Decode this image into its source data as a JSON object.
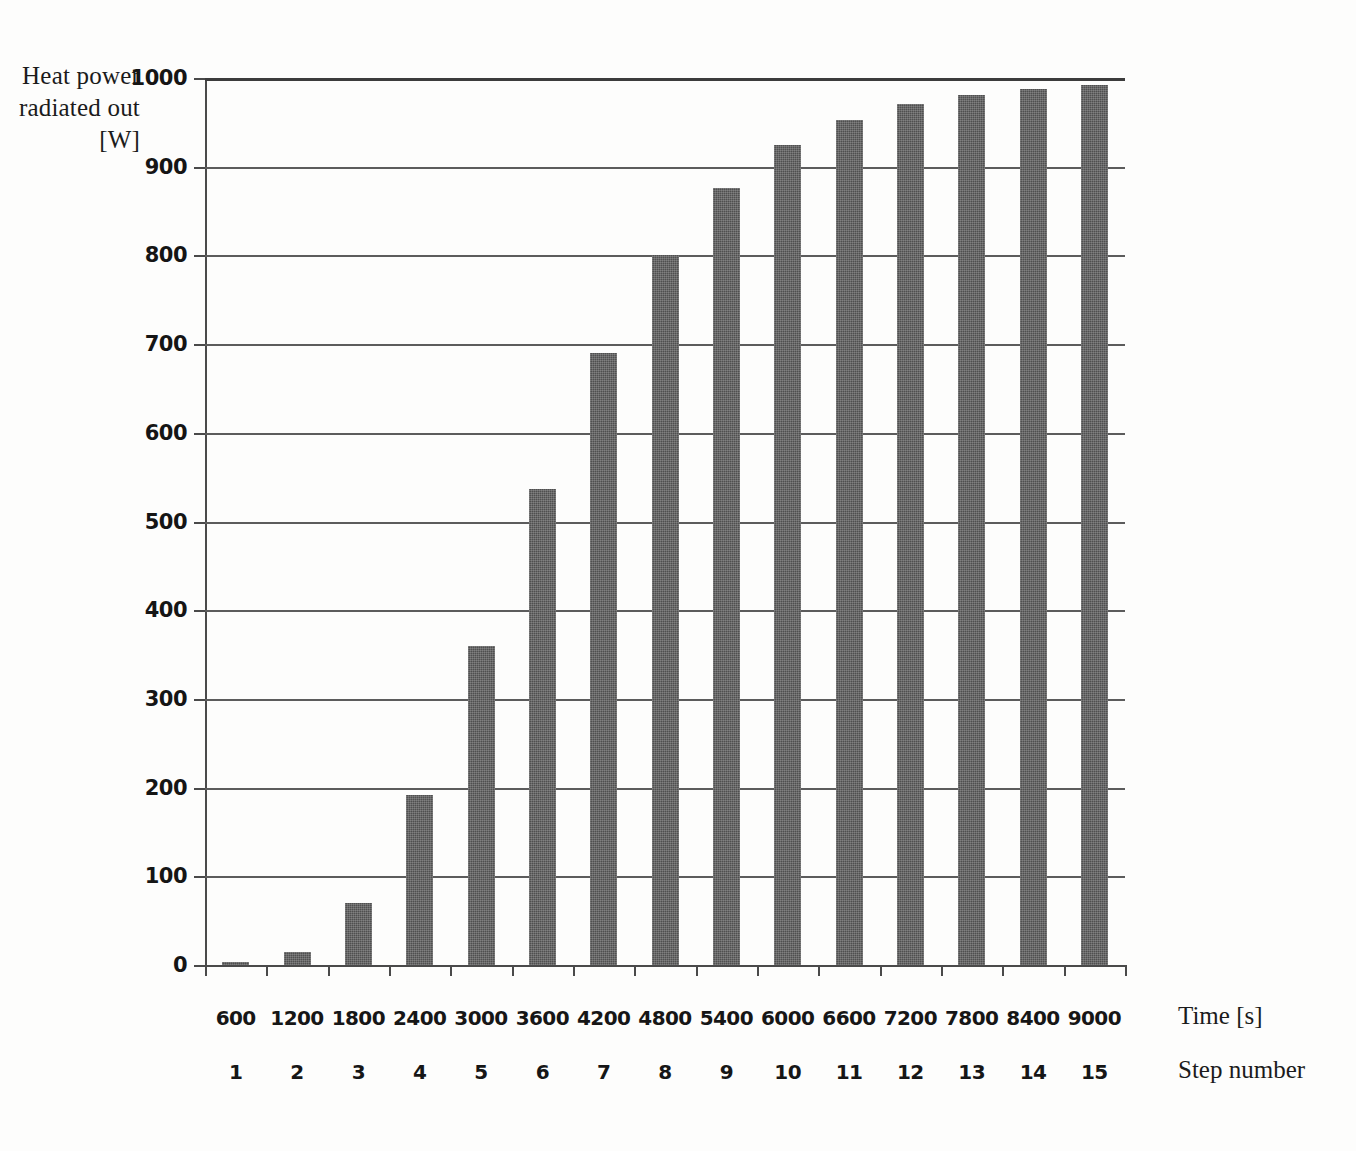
{
  "chart_data": {
    "type": "bar",
    "title": "",
    "ylabel": "Heat power radiated out [W]",
    "ylabel_lines": [
      "Heat power",
      "radiated out",
      "[W]"
    ],
    "xlabel": "Time [s]",
    "xlabel_secondary": "Step number",
    "ylim": [
      0,
      1000
    ],
    "yticks": [
      0,
      100,
      200,
      300,
      400,
      500,
      600,
      700,
      800,
      900,
      1000
    ],
    "ytick_labels": [
      "0",
      "100",
      "200",
      "300",
      "400",
      "500",
      "600",
      "700",
      "800",
      "900",
      "1000"
    ],
    "grid": true,
    "legend": false,
    "categories": [
      "600",
      "1200",
      "1800",
      "2400",
      "3000",
      "3600",
      "4200",
      "4800",
      "5400",
      "6000",
      "6600",
      "7200",
      "7800",
      "8400",
      "9000"
    ],
    "categories_secondary": [
      "1",
      "2",
      "3",
      "4",
      "5",
      "6",
      "7",
      "8",
      "9",
      "10",
      "11",
      "12",
      "13",
      "14",
      "15"
    ],
    "values": [
      2,
      15,
      70,
      192,
      360,
      537,
      690,
      800,
      876,
      925,
      953,
      971,
      981,
      988,
      992
    ],
    "bar_color": "#4f4f4f",
    "axis_color": "#4a4a4a",
    "background_color": "#ffffff"
  }
}
